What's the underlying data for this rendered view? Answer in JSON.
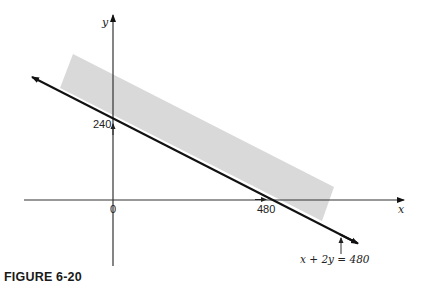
{
  "figure": {
    "caption": "FIGURE 6-20",
    "axes": {
      "x_label": "x",
      "y_label": "y",
      "origin_label": "0"
    },
    "intercepts": {
      "y_intercept_label": "240",
      "x_intercept_label": "480"
    },
    "line": {
      "equation_label": "x + 2y = 480",
      "color": "#111111"
    },
    "shaded_region": {
      "description": "half-plane band above the line x + 2y = 480",
      "color": "#d9d9d9"
    }
  }
}
